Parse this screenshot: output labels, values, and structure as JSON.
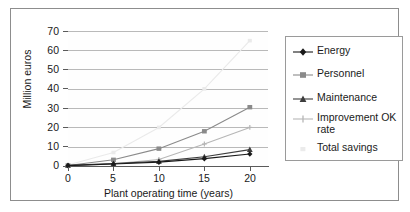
{
  "chart_data": {
    "type": "line",
    "title": "",
    "xlabel": "Plant operating time (years)",
    "ylabel": "Million euros",
    "x": [
      0,
      5,
      10,
      15,
      20
    ],
    "xlim": [
      0,
      22
    ],
    "ylim": [
      0,
      70
    ],
    "xticks": [
      "0",
      "5",
      "10",
      "15",
      "20"
    ],
    "yticks": [
      "0",
      "10",
      "20",
      "30",
      "40",
      "50",
      "60",
      "70"
    ],
    "grid": "horizontal",
    "legend_position": "right",
    "series": [
      {
        "name": "Energy",
        "marker": "diamond",
        "color": "#1a1a1a",
        "values": [
          0.2,
          1.0,
          2.0,
          3.8,
          6.2
        ]
      },
      {
        "name": "Personnel",
        "marker": "square",
        "color": "#8a8a8a",
        "values": [
          0.3,
          3.2,
          9.0,
          18.0,
          30.5
        ]
      },
      {
        "name": "Maintenance",
        "marker": "triangle",
        "color": "#3d3d3d",
        "values": [
          0.3,
          1.3,
          2.4,
          4.8,
          8.5
        ]
      },
      {
        "name": "Improvement OK rate",
        "marker": "cross",
        "color": "#b6b6b6",
        "values": [
          0.2,
          1.1,
          3.4,
          11.4,
          20.0
        ]
      },
      {
        "name": "Total savings",
        "marker": "dot",
        "color": "#eaeaea",
        "values": [
          0.5,
          7.0,
          20.0,
          40.0,
          65.0
        ]
      }
    ]
  },
  "legend": {
    "items": [
      {
        "label": "Energy"
      },
      {
        "label": "Personnel"
      },
      {
        "label": "Maintenance"
      },
      {
        "label": "Improvement OK rate"
      },
      {
        "label": "Total savings"
      }
    ]
  },
  "axes": {
    "y_title": "Million euros",
    "x_title": "Plant operating time (years)",
    "y_labels": [
      "70",
      "60",
      "50",
      "40",
      "30",
      "20",
      "10",
      "0"
    ],
    "x_labels": [
      "0",
      "5",
      "10",
      "15",
      "20"
    ]
  }
}
